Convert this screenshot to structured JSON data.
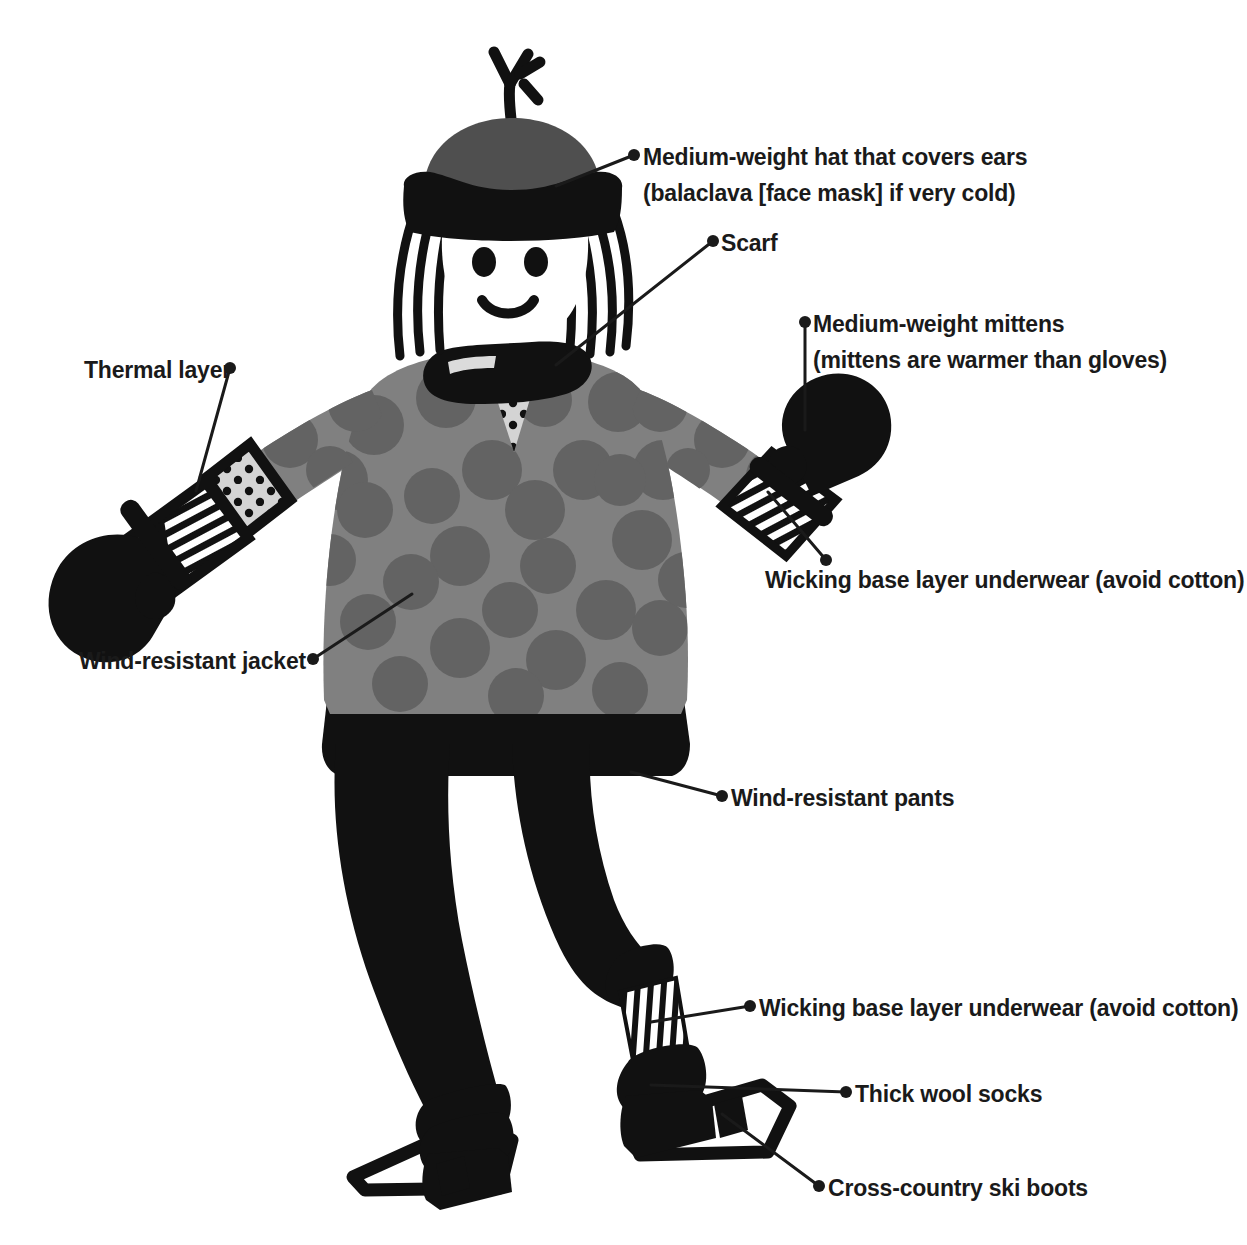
{
  "diagram": {
    "background_color": "#ffffff",
    "text_color": "#1a1a1a",
    "leader_color": "#1a1a1a"
  },
  "figure": {
    "name": "cartoon-skier-person",
    "colors": {
      "skin": "#ffffff",
      "outline": "#111111",
      "hat_crown": "#4f4f4f",
      "hat_brim": "#111111",
      "hair": "#111111",
      "scarf": "#111111",
      "jacket": "#808080",
      "jacket_dots": "#636363",
      "thermal_layer": "#d4d4d4",
      "thermal_dots": "#111111",
      "pants": "#111111",
      "mittens": "#111111",
      "base_layer_stripe_light": "#ffffff",
      "base_layer_stripe_dark": "#111111",
      "socks": "#111111",
      "boots": "#111111",
      "skis": "#111111"
    },
    "parts": [
      "hat-with-pompom",
      "hair",
      "face",
      "scarf",
      "jacket",
      "thermal-layer-vee",
      "left-mitten",
      "right-mitten",
      "left-base-layer-cuff",
      "right-base-layer-cuff",
      "pants",
      "wool-socks",
      "ski-boots",
      "skis"
    ]
  },
  "labels": [
    {
      "id": "hat",
      "name": "label-hat",
      "line1": "Medium-weight hat that covers ears",
      "line2": "(balaclava [face mask] if very cold)",
      "side": "right",
      "text_x": 643,
      "text_y": 139,
      "dot_x": 634,
      "dot_y": 155,
      "leader": "M634,155 L556,186"
    },
    {
      "id": "scarf",
      "name": "label-scarf",
      "line1": "Scarf",
      "line2": "",
      "side": "right",
      "text_x": 721,
      "text_y": 225,
      "dot_x": 713,
      "dot_y": 241,
      "leader": "M713,241 L556,365"
    },
    {
      "id": "mittens",
      "name": "label-mittens",
      "line1": "Medium-weight mittens",
      "line2": "(mittens are warmer than gloves)",
      "side": "right",
      "text_x": 813,
      "text_y": 306,
      "dot_x": 805,
      "dot_y": 322,
      "leader": "M805,322 L805,430"
    },
    {
      "id": "thermal",
      "name": "label-thermal-layer",
      "line1": "Thermal layer",
      "line2": "",
      "side": "left",
      "text_x": 84,
      "text_y": 352,
      "dot_x": 230,
      "dot_y": 368,
      "leader": "M230,368 L196,491"
    },
    {
      "id": "wicking-arm",
      "name": "label-wicking-base-layer-arm",
      "line1": "Wicking base layer underwear (avoid cotton)",
      "line2": "",
      "side": "right",
      "text_x": 765,
      "text_y": 562,
      "dot_x": 826,
      "dot_y": 560,
      "leader": "M826,560 L768,492"
    },
    {
      "id": "jacket",
      "name": "label-wind-resistant-jacket",
      "line1": "Wind-resistant jacket",
      "line2": "",
      "side": "left",
      "text_x": 79,
      "text_y": 643,
      "dot_x": 313,
      "dot_y": 659,
      "leader": "M313,659 L412,594"
    },
    {
      "id": "pants",
      "name": "label-wind-resistant-pants",
      "line1": "Wind-resistant pants",
      "line2": "",
      "side": "right",
      "text_x": 731,
      "text_y": 780,
      "dot_x": 722,
      "dot_y": 796,
      "leader": "M722,796 L631,772"
    },
    {
      "id": "wicking-leg",
      "name": "label-wicking-base-layer-leg",
      "line1": "Wicking base layer underwear (avoid cotton)",
      "line2": "",
      "side": "right",
      "text_x": 759,
      "text_y": 990,
      "dot_x": 750,
      "dot_y": 1006,
      "leader": "M750,1006 L651,1022"
    },
    {
      "id": "socks",
      "name": "label-thick-wool-socks",
      "line1": "Thick wool socks",
      "line2": "",
      "side": "right",
      "text_x": 855,
      "text_y": 1076,
      "dot_x": 846,
      "dot_y": 1092,
      "leader": "M846,1092 L651,1085"
    },
    {
      "id": "boots",
      "name": "label-cross-country-ski-boots",
      "line1": "Cross-country ski boots",
      "line2": "",
      "side": "right",
      "text_x": 828,
      "text_y": 1170,
      "dot_x": 819,
      "dot_y": 1186,
      "leader": "M819,1186 L722,1114"
    }
  ]
}
